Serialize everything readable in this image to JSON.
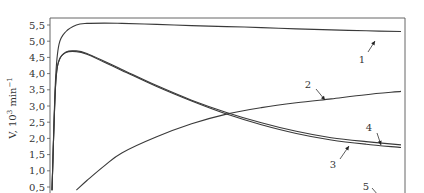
{
  "chart_data": {
    "type": "line",
    "title": "",
    "xlabel": "",
    "ylabel": "V, 10³ min⁻¹",
    "ylabel_parts": {
      "base": "V, 10",
      "sup1": "3",
      "mid": " min",
      "sup2": "−1"
    },
    "ylim": [
      0.4,
      5.7
    ],
    "yticks": [
      0.5,
      1.0,
      1.5,
      2.0,
      2.5,
      3.0,
      3.5,
      4.0,
      4.5,
      5.0,
      5.5
    ],
    "ytick_labels": [
      "0,5",
      "1,0",
      "1,5",
      "2,0",
      "2,5",
      "3,0",
      "3,5",
      "4,0",
      "4,5",
      "5,0",
      "5,5"
    ],
    "grid": false,
    "x_normalized": [
      0.0,
      0.01,
      0.02,
      0.04,
      0.07,
      0.1,
      0.15,
      0.2,
      0.3,
      0.4,
      0.5,
      0.6,
      0.7,
      0.8,
      0.9,
      1.0
    ],
    "series": [
      {
        "name": "1",
        "values": [
          0.4,
          3.8,
          4.9,
          5.3,
          5.5,
          5.55,
          5.56,
          5.55,
          5.52,
          5.48,
          5.45,
          5.42,
          5.38,
          5.35,
          5.32,
          5.3
        ]
      },
      {
        "name": "2",
        "values": [
          null,
          null,
          null,
          null,
          0.4,
          0.7,
          1.15,
          1.55,
          2.05,
          2.45,
          2.75,
          2.95,
          3.1,
          3.22,
          3.35,
          3.45
        ]
      },
      {
        "name": "3",
        "values": [
          0.4,
          3.6,
          4.4,
          4.65,
          4.68,
          4.6,
          4.35,
          4.1,
          3.6,
          3.15,
          2.75,
          2.42,
          2.15,
          1.95,
          1.82,
          1.72
        ]
      },
      {
        "name": "4",
        "values": [
          0.4,
          3.6,
          4.4,
          4.67,
          4.7,
          4.62,
          4.38,
          4.13,
          3.63,
          3.18,
          2.8,
          2.48,
          2.22,
          2.02,
          1.9,
          1.8
        ]
      },
      {
        "name": "5",
        "values": []
      }
    ],
    "annotations": [
      {
        "text": "1",
        "target_series": "1"
      },
      {
        "text": "2",
        "target_series": "2"
      },
      {
        "text": "3",
        "target_series": "3"
      },
      {
        "text": "4",
        "target_series": "4"
      },
      {
        "text": "5",
        "target_series": "5"
      }
    ]
  }
}
